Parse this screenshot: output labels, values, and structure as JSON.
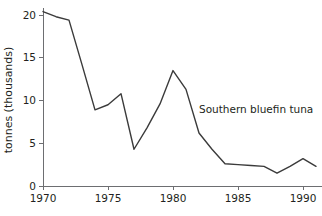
{
  "chart_data": {
    "type": "line",
    "title": "",
    "subtitle": "",
    "xlabel": "",
    "ylabel": "tonnes (thousands)",
    "xlim": [
      1970,
      1991
    ],
    "ylim": [
      0,
      21
    ],
    "grid": false,
    "legend_position": "inline-annotation",
    "x_ticks": [
      "1970",
      "1975",
      "1980",
      "1985",
      "1990"
    ],
    "x_tick_values": [
      1970,
      1975,
      1980,
      1985,
      1990
    ],
    "y_ticks": [
      "0",
      "5",
      "10",
      "15",
      "20"
    ],
    "y_tick_values": [
      0,
      5,
      10,
      15,
      20
    ],
    "annotations": [
      {
        "text": "Southern bluefin tuna",
        "x": 1982.0,
        "y": 8.5
      }
    ],
    "series": [
      {
        "name": "Southern bluefin tuna",
        "color": "#3b3b3b",
        "x": [
          1970,
          1971,
          1972,
          1973,
          1974,
          1975,
          1976,
          1977,
          1978,
          1979,
          1980,
          1981,
          1982,
          1983,
          1984,
          1985,
          1986,
          1987,
          1988,
          1989,
          1990,
          1991
        ],
        "values": [
          20.4,
          19.8,
          19.4,
          14.2,
          8.9,
          9.5,
          10.8,
          4.3,
          6.8,
          9.6,
          13.5,
          11.3,
          6.2,
          4.3,
          2.6,
          2.5,
          2.4,
          2.3,
          1.5,
          2.3,
          3.2,
          2.3
        ]
      }
    ]
  },
  "axis": {
    "y_title": "tonnes (thousands)"
  }
}
